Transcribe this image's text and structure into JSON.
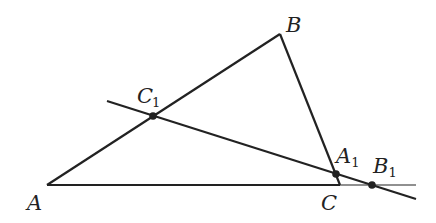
{
  "diagram": {
    "type": "triangle-with-transversal",
    "colors": {
      "stroke": "#222222",
      "background": "#ffffff"
    },
    "points": {
      "A": {
        "label": "A",
        "sub": "",
        "x": 47,
        "y": 185
      },
      "B": {
        "label": "B",
        "sub": "",
        "x": 280,
        "y": 34
      },
      "C": {
        "label": "C",
        "sub": "",
        "x": 340,
        "y": 185
      },
      "A1": {
        "label": "A",
        "sub": "1",
        "x": 336,
        "y": 173
      },
      "B1": {
        "label": "B",
        "sub": "1",
        "x": 372,
        "y": 185
      },
      "C1": {
        "label": "C",
        "sub": "1",
        "x": 153,
        "y": 116
      }
    },
    "segments": [
      {
        "from": "A",
        "to": "B"
      },
      {
        "from": "B",
        "to": "C"
      },
      {
        "from": "A",
        "to": "C",
        "extended_to": [
          416,
          185
        ]
      },
      {
        "name": "transversal",
        "from": [
          107,
          101
        ],
        "to": [
          416,
          199
        ]
      }
    ],
    "marked_points": [
      "C1",
      "A1",
      "B1"
    ]
  }
}
